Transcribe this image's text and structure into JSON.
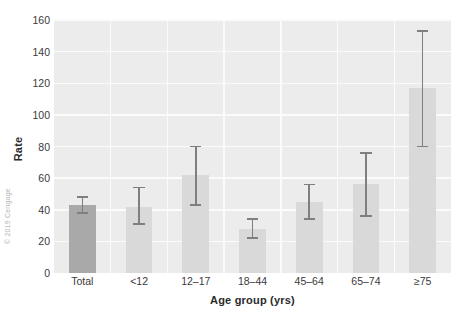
{
  "figure": {
    "credit": "© 2019 Cengage"
  },
  "chart_data": {
    "type": "bar",
    "title": "",
    "xlabel": "Age group (yrs)",
    "ylabel": "Rate",
    "categories": [
      "Total",
      "<12",
      "12–17",
      "18–44",
      "45–64",
      "65–74",
      "≥75"
    ],
    "values": [
      43,
      42,
      62,
      28,
      45,
      56,
      117
    ],
    "error_low": [
      38,
      31,
      43,
      22,
      34,
      36,
      80
    ],
    "error_high": [
      48,
      54,
      80,
      34,
      56,
      76,
      153
    ],
    "ylim": [
      0,
      160
    ],
    "yticks": [
      0,
      20,
      40,
      60,
      80,
      100,
      120,
      140,
      160
    ],
    "ytick_labels": [
      "0",
      "20",
      "40",
      "60",
      "80",
      "100",
      "120",
      "140",
      "160"
    ],
    "grid": true,
    "legend": "none",
    "highlight_index": 0,
    "colors": {
      "bar": "#d9d9d9",
      "bar_highlight": "#a9a9a9",
      "error": "#7f7f7f",
      "plot_background": "#ececec",
      "gridline": "#fbfbfb",
      "figure_background": "#ffffff",
      "text": "#3a3a3a"
    }
  }
}
